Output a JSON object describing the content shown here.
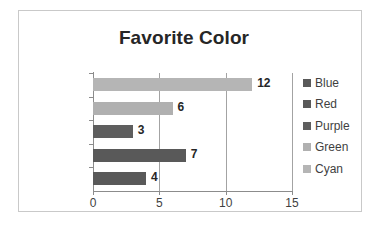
{
  "chart_data": {
    "type": "bar",
    "orientation": "horizontal",
    "title": "Favorite Color",
    "xlabel": "",
    "ylabel": "",
    "categories": [
      "Blue",
      "Red",
      "Purple",
      "Green",
      "Cyan"
    ],
    "values": [
      4,
      7,
      3,
      6,
      12
    ],
    "display_order_top_to_bottom": [
      "Cyan",
      "Green",
      "Purple",
      "Red",
      "Blue"
    ],
    "data_labels": [
      "12",
      "6",
      "3",
      "7",
      "4"
    ],
    "xlim": [
      0,
      15
    ],
    "xticks": [
      "0",
      "5",
      "10",
      "15"
    ],
    "xtick_values": [
      0,
      5,
      10,
      15
    ],
    "grid": "vertical",
    "legend_position": "right",
    "legend": [
      {
        "label": "Blue",
        "color": "#595959"
      },
      {
        "label": "Red",
        "color": "#595959"
      },
      {
        "label": "Purple",
        "color": "#5e5e5e"
      },
      {
        "label": "Green",
        "color": "#b0b0b0"
      },
      {
        "label": "Cyan",
        "color": "#b5b5b5"
      }
    ],
    "bars_top_to_bottom": [
      {
        "category": "Cyan",
        "value": 12,
        "label": "12",
        "color": "#b5b5b5"
      },
      {
        "category": "Green",
        "value": 6,
        "label": "6",
        "color": "#b0b0b0"
      },
      {
        "category": "Purple",
        "value": 3,
        "label": "3",
        "color": "#5e5e5e"
      },
      {
        "category": "Red",
        "value": 7,
        "label": "7",
        "color": "#595959"
      },
      {
        "category": "Blue",
        "value": 4,
        "label": "4",
        "color": "#595959"
      }
    ],
    "colors": {
      "axis": "#8c8c8c",
      "gridline": "#a3a3a3",
      "border": "#c9c9c9",
      "title_text": "#262626",
      "tick_text": "#3f3f3f",
      "background": "#ffffff"
    }
  }
}
